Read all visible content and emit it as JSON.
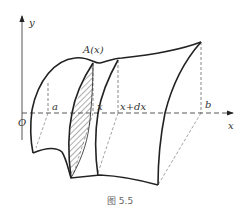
{
  "figure": {
    "caption": "图 5.5",
    "axes": {
      "x_label": "x",
      "y_label": "y",
      "origin_label": "O"
    },
    "labels": {
      "cross_section": "A(x)",
      "a": "a",
      "x": "x",
      "x_plus_dx": "x+dx",
      "b": "b"
    },
    "colors": {
      "stroke": "#222222",
      "dashed": "#555555",
      "text": "#333333"
    }
  }
}
